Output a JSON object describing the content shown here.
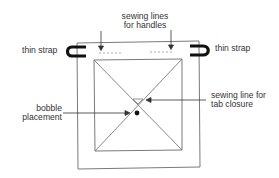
{
  "diagram": {
    "type": "sewing-pattern-schematic",
    "labels": {
      "sewing_lines_handles_line1": "sewing lines",
      "sewing_lines_handles_line2": "for handles",
      "thin_strap_left": "thin strap",
      "thin_strap_right": "thin strap",
      "bobble_line1": "bobble",
      "bobble_line2": "placement",
      "tab_closure_line1": "sewing line for",
      "tab_closure_line2": "tab closure"
    },
    "colors": {
      "outline": "#7a7a7a",
      "strap": "#111111",
      "arrow": "#333333",
      "stitch": "#aaaaaa",
      "text": "#333333",
      "background": "#ffffff"
    }
  }
}
